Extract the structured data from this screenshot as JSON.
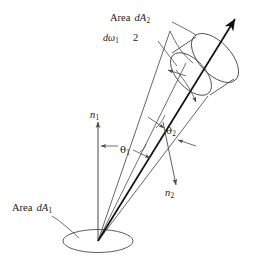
{
  "figure": {
    "background_color": "#ffffff",
    "stroke_color": "#4a4a4a",
    "bold_stroke_color": "#111111",
    "text_color": "#1a1a1a",
    "width": 261,
    "height": 260
  },
  "labels": {
    "area_dA2": {
      "word": "Area",
      "symbol": "dA",
      "subscript": "2"
    },
    "domega1": {
      "symbol": "dω",
      "subscript": "1"
    },
    "two": {
      "text": "2"
    },
    "n1": {
      "symbol": "n",
      "subscript": "1"
    },
    "n2": {
      "symbol": "n",
      "subscript": "2"
    },
    "theta1": {
      "symbol": "θ",
      "subscript": "1"
    },
    "theta2": {
      "symbol": "θ",
      "subscript": "2"
    },
    "area_dA1": {
      "word": "Area",
      "symbol": "dA",
      "subscript": "1"
    }
  },
  "elements": {
    "surface_ellipse": "dA1-surface-patch",
    "far_patch": "dA2-tube-patch",
    "main_ray": "central-radiance-ray",
    "normal1": "surface-normal-n1",
    "normal2": "surface-normal-n2",
    "solid_angle_cone": "dw1-solid-angle-cone",
    "theta1_marker": "theta1-angle-arrow",
    "theta2_marker": "theta2-angle-arrow",
    "dA2_extent_marker": "dA2-extent-arrow",
    "domega1_leader": "dw1-leader-line",
    "dA2_leader": "dA2-leader-line",
    "dA1_leader": "dA1-leader-line"
  }
}
